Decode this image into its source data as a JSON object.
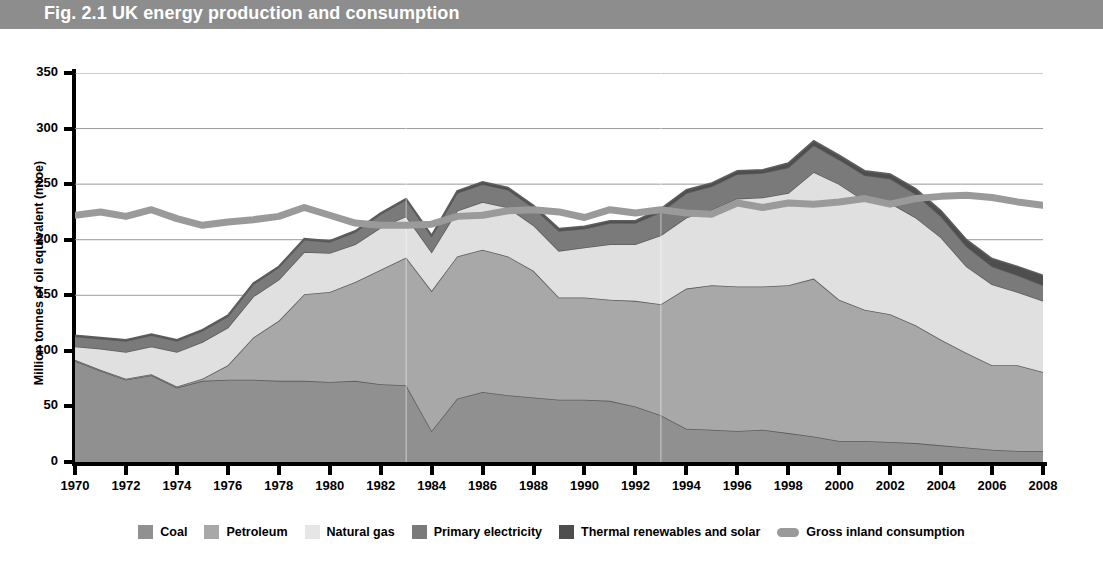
{
  "banner": {
    "title": "Fig. 2.1 UK energy production and consumption",
    "background_color": "#8d8d8d",
    "text_color": "#ffffff"
  },
  "chart_data": {
    "type": "area",
    "title": "Fig. 2.1 UK energy production and consumption",
    "xlabel": "",
    "ylabel": "Million tonnes of oil equivalent (mtoe)",
    "xlim": [
      1970,
      2008
    ],
    "ylim": [
      0,
      350
    ],
    "grid": true,
    "legend_position": "bottom",
    "stacked": true,
    "x": [
      1970,
      1971,
      1972,
      1973,
      1974,
      1975,
      1976,
      1977,
      1978,
      1979,
      1980,
      1981,
      1982,
      1983,
      1984,
      1985,
      1986,
      1987,
      1988,
      1989,
      1990,
      1991,
      1992,
      1993,
      1994,
      1995,
      1996,
      1997,
      1998,
      1999,
      2000,
      2001,
      2002,
      2003,
      2004,
      2005,
      2006,
      2007,
      2008
    ],
    "xticks": [
      1970,
      1972,
      1974,
      1976,
      1978,
      1980,
      1982,
      1984,
      1986,
      1988,
      1990,
      1992,
      1994,
      1996,
      1998,
      2000,
      2002,
      2004,
      2006,
      2008
    ],
    "yticks": [
      0,
      50,
      100,
      150,
      200,
      250,
      300,
      350
    ],
    "series": [
      {
        "name": "Coal",
        "color": "#909090",
        "values": [
          91,
          82,
          74,
          78,
          67,
          73,
          74,
          74,
          73,
          73,
          72,
          73,
          70,
          69,
          28,
          57,
          63,
          60,
          58,
          56,
          56,
          55,
          50,
          42,
          30,
          29,
          28,
          29,
          26,
          23,
          19,
          19,
          18,
          17,
          15,
          13,
          11,
          10,
          10
        ]
      },
      {
        "name": "Petroleum",
        "color": "#a8a8a8",
        "values": [
          1,
          1,
          1,
          1,
          1,
          2,
          13,
          38,
          54,
          78,
          81,
          89,
          103,
          115,
          126,
          128,
          128,
          125,
          114,
          92,
          92,
          91,
          95,
          100,
          126,
          130,
          130,
          129,
          133,
          142,
          127,
          118,
          115,
          106,
          95,
          85,
          76,
          77,
          71
        ]
      },
      {
        "name": "Natural gas",
        "color": "#e0e0e0",
        "values": [
          12,
          19,
          24,
          25,
          31,
          33,
          34,
          37,
          37,
          38,
          35,
          34,
          38,
          37,
          35,
          41,
          43,
          44,
          41,
          42,
          45,
          50,
          51,
          62,
          64,
          68,
          79,
          80,
          83,
          96,
          104,
          98,
          100,
          97,
          92,
          78,
          73,
          66,
          64
        ]
      },
      {
        "name": "Primary electricity",
        "color": "#7a7a7a",
        "values": [
          9,
          9,
          10,
          10,
          10,
          10,
          10,
          11,
          11,
          11,
          10,
          11,
          12,
          15,
          14,
          16,
          16,
          16,
          16,
          18,
          17,
          19,
          19,
          21,
          22,
          21,
          22,
          22,
          23,
          24,
          22,
          23,
          22,
          21,
          19,
          18,
          16,
          15,
          14
        ]
      },
      {
        "name": "Thermal renewables and solar",
        "color": "#4e4e4e",
        "values": [
          1,
          1,
          1,
          1,
          1,
          1,
          1,
          1,
          1,
          1,
          1,
          1,
          1,
          1,
          1,
          2,
          2,
          2,
          2,
          2,
          2,
          2,
          2,
          3,
          3,
          3,
          3,
          3,
          4,
          4,
          4,
          4,
          4,
          5,
          5,
          6,
          7,
          8,
          9
        ]
      }
    ],
    "line_series": {
      "name": "Gross inland consumption",
      "color": "#9a9a9a",
      "values": [
        222,
        225,
        221,
        227,
        219,
        213,
        216,
        218,
        221,
        229,
        222,
        215,
        213,
        213,
        214,
        221,
        222,
        226,
        227,
        225,
        220,
        227,
        224,
        227,
        224,
        223,
        233,
        229,
        233,
        232,
        234,
        237,
        232,
        237,
        239,
        240,
        238,
        234,
        231
      ]
    }
  },
  "y_axis": {
    "title": "Million tonnes of oil equivalent (mtoe)",
    "ticks": [
      "0",
      "50",
      "100",
      "150",
      "200",
      "250",
      "300",
      "350"
    ]
  },
  "x_axis": {
    "ticks": [
      "1970",
      "1972",
      "1974",
      "1976",
      "1978",
      "1980",
      "1982",
      "1984",
      "1986",
      "1988",
      "1990",
      "1992",
      "1994",
      "1996",
      "1998",
      "2000",
      "2002",
      "2004",
      "2006",
      "2008"
    ]
  },
  "legend": {
    "items": [
      {
        "label": "Coal",
        "color": "#909090",
        "shape": "square"
      },
      {
        "label": "Petroleum",
        "color": "#a8a8a8",
        "shape": "square"
      },
      {
        "label": "Natural gas",
        "color": "#e6e6e6",
        "shape": "square"
      },
      {
        "label": "Primary electricity",
        "color": "#7a7a7a",
        "shape": "square"
      },
      {
        "label": "Thermal renewables and solar",
        "color": "#4e4e4e",
        "shape": "square"
      },
      {
        "label": "Gross inland consumption",
        "color": "#9a9a9a",
        "shape": "line"
      }
    ]
  }
}
